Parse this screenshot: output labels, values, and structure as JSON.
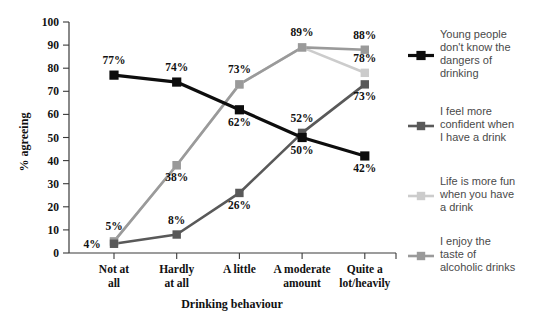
{
  "chart_data": {
    "type": "line",
    "title": "",
    "xlabel": "Drinking behaviour",
    "ylabel": "% agreeing",
    "ylim": [
      0,
      100
    ],
    "ytick_values": [
      0,
      10,
      20,
      30,
      40,
      50,
      60,
      70,
      80,
      90,
      100
    ],
    "ytick_labels": [
      "0",
      "10",
      "20",
      "30",
      "40",
      "50",
      "60",
      "70",
      "80",
      "90",
      "100"
    ],
    "grid": false,
    "legend_position": "right",
    "categories": [
      "Not at all",
      "Hardly at all",
      "A little",
      "A moderate amount",
      "Quite a lot/heavily"
    ],
    "category_lines": [
      [
        "Not at",
        "all"
      ],
      [
        "Hardly",
        "at all"
      ],
      [
        "A little"
      ],
      [
        "A moderate",
        "amount"
      ],
      [
        "Quite a",
        "lot/heavily"
      ]
    ],
    "series": [
      {
        "name": "Young people don't know the dangers of drinking",
        "legend_lines": [
          "Young people",
          "don't know the",
          "dangers of",
          "drinking"
        ],
        "color": "#0d0d0d",
        "values": [
          77,
          74,
          62,
          50,
          42
        ],
        "point_labels": [
          "77%",
          "74%",
          "62%",
          "50%",
          "42%"
        ],
        "label_positions": [
          "above",
          "above",
          "below",
          "below",
          "below"
        ]
      },
      {
        "name": "I feel more confident when I have a drink",
        "legend_lines": [
          "I feel more",
          "confident when",
          "I have a drink"
        ],
        "color": "#595959",
        "values": [
          4,
          8,
          26,
          52,
          73
        ],
        "point_labels": [
          "4%",
          "8%",
          "26%",
          "52%",
          "73%"
        ],
        "label_positions": [
          "left",
          "above",
          "below",
          "above",
          "below"
        ]
      },
      {
        "name": "Life is more fun when you have a drink",
        "legend_lines": [
          "Life is more fun",
          "when you have",
          "a drink"
        ],
        "color": "#cccccc",
        "values": [
          5,
          38,
          73,
          89,
          78
        ],
        "point_labels": [
          "",
          "",
          "",
          "",
          "78%"
        ],
        "label_positions": [
          "above",
          "above",
          "above",
          "above",
          "above"
        ]
      },
      {
        "name": "I enjoy the taste of alcoholic drinks",
        "legend_lines": [
          "I enjoy the",
          "taste of",
          "alcoholic drinks"
        ],
        "color": "#9a9a9a",
        "values": [
          5,
          38,
          73,
          89,
          88
        ],
        "point_labels": [
          "5%",
          "38%",
          "73%",
          "89%",
          "88%"
        ],
        "label_positions": [
          "above",
          "below",
          "above",
          "above",
          "above"
        ]
      }
    ]
  },
  "axes": {
    "ylabel": "% agreeing",
    "xlabel": "Drinking behaviour"
  }
}
